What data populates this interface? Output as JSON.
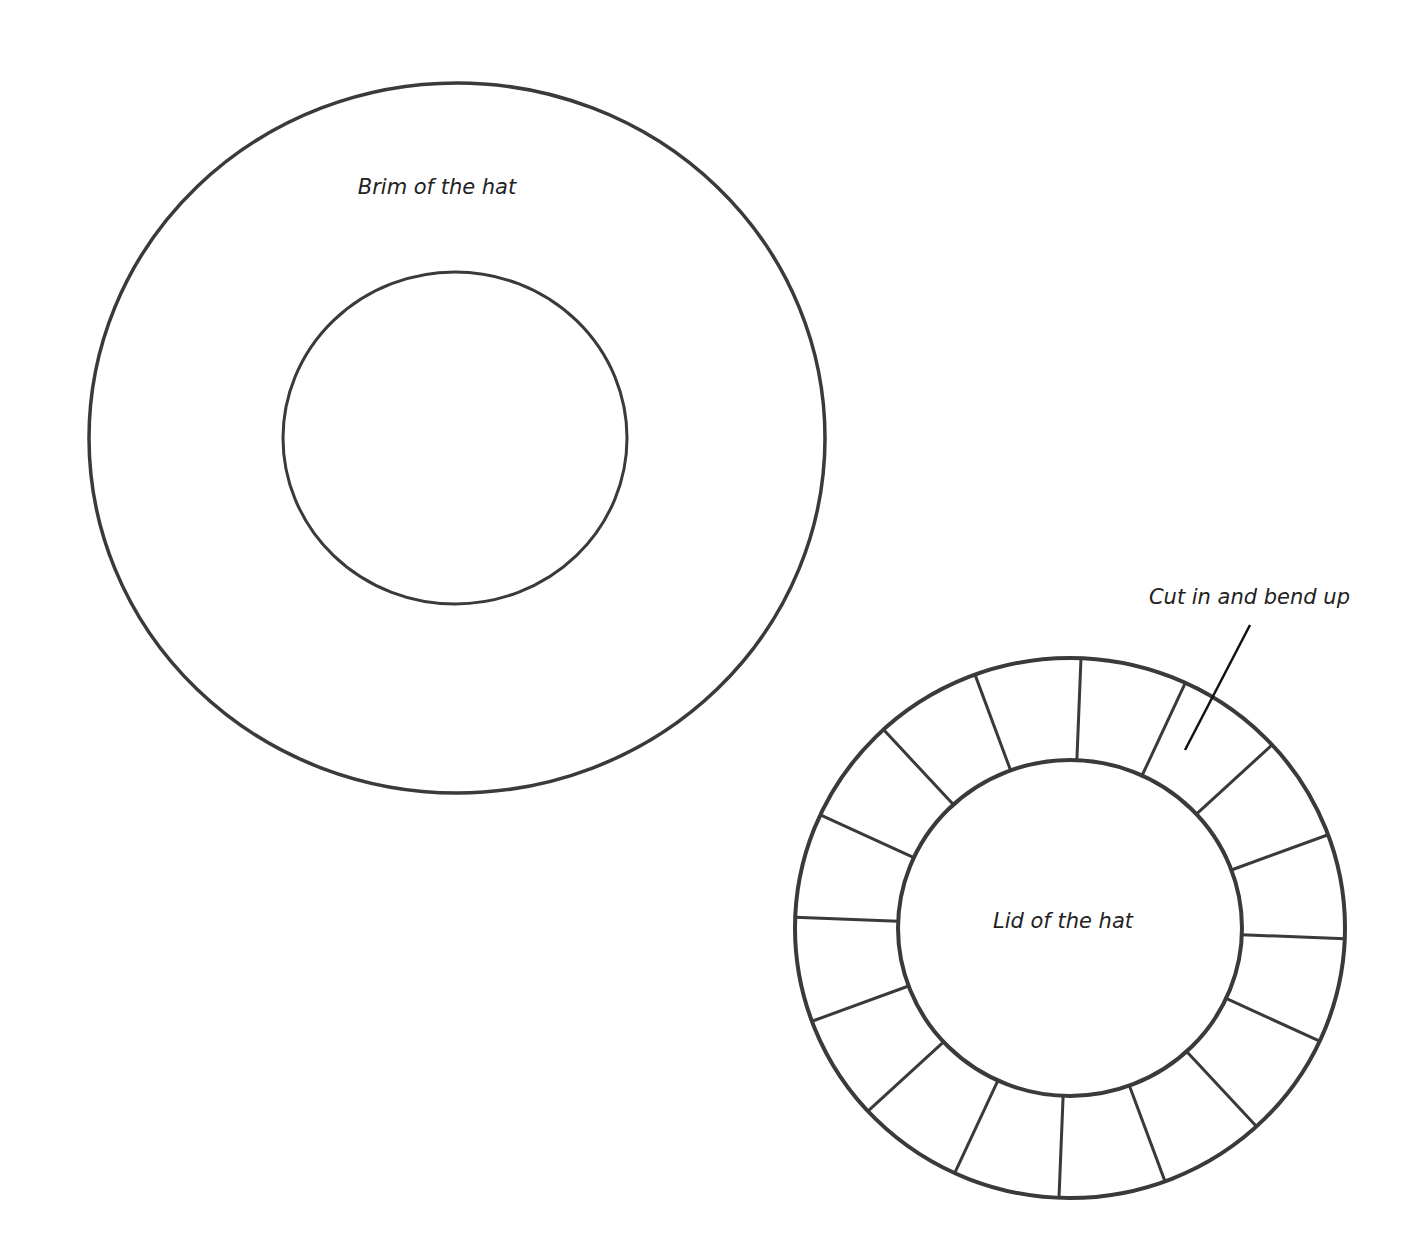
{
  "diagram": {
    "brim": {
      "label": "Brim of the hat",
      "center": [
        457,
        438
      ],
      "outer_radius": [
        368,
        355
      ],
      "inner_radius": [
        172,
        166
      ]
    },
    "lid": {
      "label": "Lid of the hat",
      "center": [
        1070,
        928
      ],
      "outer_radius": [
        275,
        270
      ],
      "inner_radius": [
        172,
        168
      ],
      "tab_count": 16,
      "annotation": {
        "label": "Cut in and bend up",
        "line_from": [
          1250,
          625
        ],
        "line_to": [
          1185,
          750
        ]
      }
    },
    "colors": {
      "line": "#3a3a3a",
      "text": "#222222",
      "background": "#ffffff"
    }
  }
}
